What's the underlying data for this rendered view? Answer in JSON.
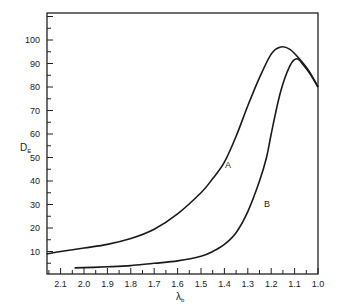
{
  "chart_data": {
    "type": "line",
    "title": "",
    "xlabel": "λb",
    "ylabel": "DE",
    "xlim": [
      2.16,
      1.0
    ],
    "ylim": [
      0,
      110
    ],
    "x_reversed": true,
    "grid": false,
    "legend": "none (inline curve labels)",
    "x_ticks": [
      "2.1",
      "2.0",
      "1.9",
      "1.8",
      "1.7",
      "1.6",
      "1.5",
      "1.4",
      "1.3",
      "1.2",
      "1.1",
      "1.0"
    ],
    "y_ticks": [
      "10",
      "20",
      "30",
      "40",
      "50",
      "60",
      "70",
      "80",
      "90",
      "100"
    ],
    "series": [
      {
        "name": "A",
        "x": [
          2.16,
          2.1,
          2.0,
          1.9,
          1.8,
          1.7,
          1.6,
          1.5,
          1.45,
          1.4,
          1.35,
          1.3,
          1.25,
          1.2,
          1.16,
          1.12,
          1.08,
          1.04,
          1.0
        ],
        "values": [
          9,
          10,
          11.5,
          13,
          15.5,
          19.5,
          26,
          35,
          41,
          48,
          59,
          72,
          84,
          94,
          97,
          96,
          92,
          87,
          80
        ]
      },
      {
        "name": "B",
        "x": [
          2.04,
          1.9,
          1.8,
          1.7,
          1.6,
          1.5,
          1.45,
          1.4,
          1.35,
          1.3,
          1.25,
          1.22,
          1.2,
          1.16,
          1.12,
          1.09,
          1.06,
          1.03,
          1.0
        ],
        "values": [
          3,
          3.5,
          4,
          5,
          6,
          8,
          10,
          13,
          18,
          27,
          40,
          50,
          60,
          78,
          89,
          92,
          89,
          85,
          80
        ]
      }
    ],
    "annotations": [
      {
        "text": "A",
        "x": 1.38,
        "y": 45
      },
      {
        "text": "B",
        "x": 1.22,
        "y": 29
      }
    ]
  },
  "labels": {
    "ylabel_main": "D",
    "ylabel_sub": "E",
    "xlabel_main": "λ",
    "xlabel_sub": "b",
    "curve_a": "A",
    "curve_b": "B"
  }
}
